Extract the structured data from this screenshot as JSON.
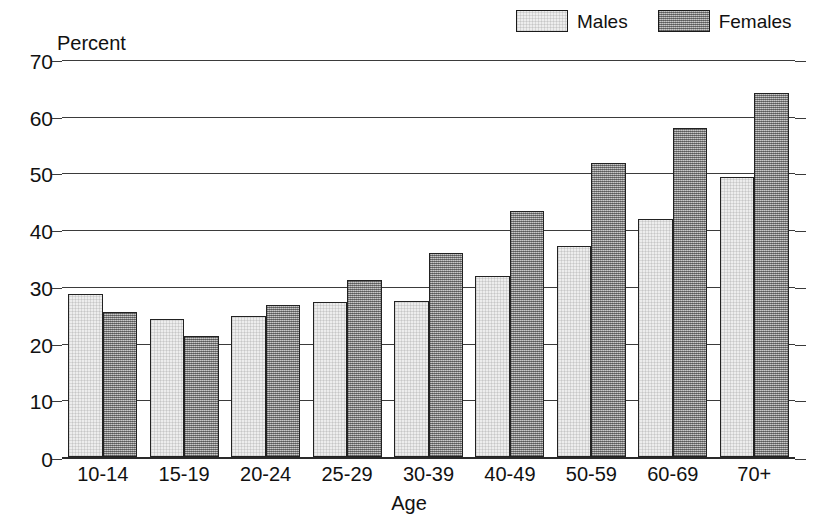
{
  "chart_data": {
    "type": "bar",
    "title": "",
    "xlabel": "Age",
    "ylabel": "Percent",
    "ylim": [
      0,
      70
    ],
    "yticks": [
      0,
      10,
      20,
      30,
      40,
      50,
      60,
      70
    ],
    "grid": true,
    "legend_position": "top-right",
    "categories": [
      "10-14",
      "15-19",
      "20-24",
      "25-29",
      "30-39",
      "40-49",
      "50-59",
      "60-69",
      "70+"
    ],
    "series": [
      {
        "name": "Males",
        "color": "#ededed",
        "values": [
          28.8,
          24.3,
          24.8,
          27.3,
          27.5,
          32.0,
          37.2,
          42.0,
          49.4
        ]
      },
      {
        "name": "Females",
        "color": "#9a9a9a",
        "values": [
          25.5,
          21.4,
          26.8,
          31.2,
          36.0,
          43.4,
          51.8,
          58.0,
          64.2
        ]
      }
    ]
  },
  "axis": {
    "y_title": "Percent",
    "x_title": "Age",
    "y_tick_labels": [
      "0",
      "10",
      "20",
      "30",
      "40",
      "50",
      "60",
      "70"
    ],
    "x_tick_labels": [
      "10-14",
      "15-19",
      "20-24",
      "25-29",
      "30-39",
      "40-49",
      "50-59",
      "60-69",
      "70+"
    ]
  },
  "legend": {
    "items": [
      {
        "label": "Males",
        "swatch": "light-stipple-swatch"
      },
      {
        "label": "Females",
        "swatch": "dark-stipple-swatch"
      }
    ]
  }
}
